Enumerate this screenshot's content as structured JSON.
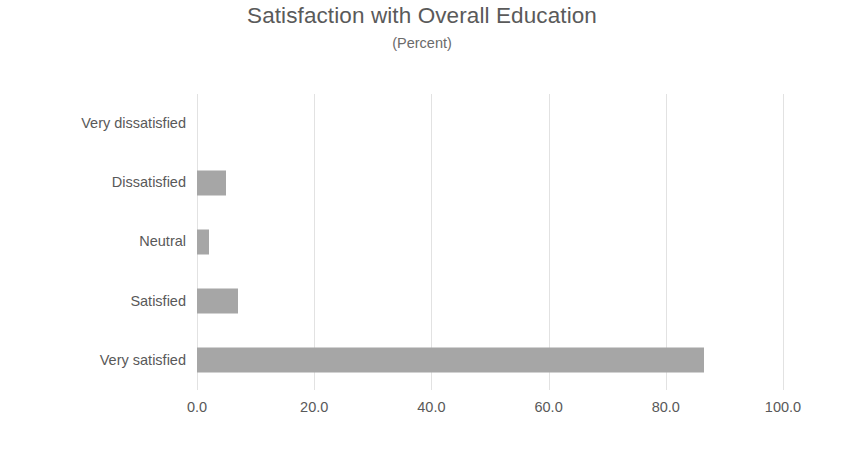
{
  "chart_data": {
    "type": "bar",
    "orientation": "horizontal",
    "title": "Satisfaction with Overall Education",
    "subtitle": "(Percent)",
    "xlabel": "",
    "ylabel": "",
    "categories": [
      "Very dissatisfied",
      "Dissatisfied",
      "Neutral",
      "Satisfied",
      "Very satisfied"
    ],
    "values": [
      0.0,
      5.0,
      2.0,
      7.0,
      86.5
    ],
    "xlim": [
      0,
      100
    ],
    "xticks": [
      0.0,
      20.0,
      40.0,
      60.0,
      80.0,
      100.0
    ],
    "xtick_labels": [
      "0.0",
      "20.0",
      "40.0",
      "60.0",
      "80.0",
      "100.0"
    ],
    "grid": "vertical",
    "legend": "none",
    "bar_color": "#a6a6a6",
    "gridline_color": "#e2e2e2",
    "text_color": "#595959",
    "title_color": "#5a5a5a",
    "background": "#ffffff"
  }
}
